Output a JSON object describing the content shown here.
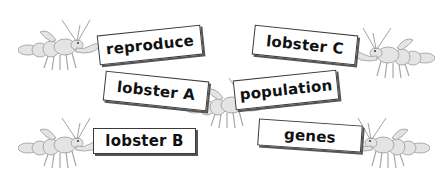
{
  "illustration": {
    "description": "Six lobsters holding word cards",
    "cards": [
      {
        "id": "reproduce",
        "label": "reproduce"
      },
      {
        "id": "lobster-a",
        "label": "lobster A"
      },
      {
        "id": "lobster-b",
        "label": "lobster B"
      },
      {
        "id": "lobster-c",
        "label": "lobster C"
      },
      {
        "id": "population",
        "label": "population"
      },
      {
        "id": "genes",
        "label": "genes"
      }
    ]
  }
}
